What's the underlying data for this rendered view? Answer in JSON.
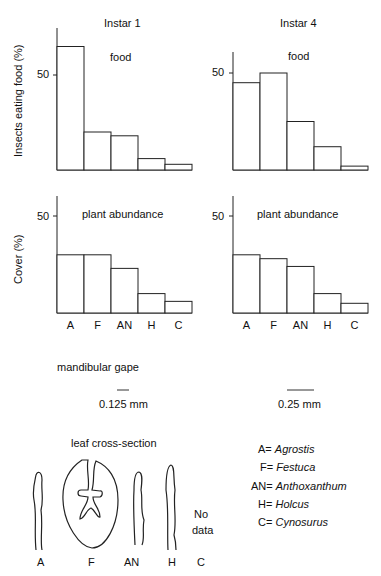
{
  "figure": {
    "ylabel_top": "Insects eating food (%)",
    "ylabel_bottom": "Cover (%)",
    "panels": [
      {
        "id": "instar1-food",
        "title": "Instar 1",
        "subtitle": "food",
        "tick": "50"
      },
      {
        "id": "instar4-food",
        "title": "Instar 4",
        "subtitle": "food",
        "tick": "50"
      },
      {
        "id": "instar1-plant",
        "subtitle": "plant abundance",
        "tick": "50"
      },
      {
        "id": "instar4-plant",
        "subtitle": "plant abundance",
        "tick": "50"
      }
    ],
    "categories": [
      "A",
      "F",
      "AN",
      "H",
      "C"
    ],
    "mandibular_gape": {
      "label": "mandibular gape",
      "instar1": "0.125 mm",
      "instar4": "0.25 mm"
    },
    "leaf": {
      "title": "leaf cross-section",
      "labels": [
        "A",
        "F",
        "AN",
        "H",
        "C"
      ],
      "no_data": [
        "No",
        "data"
      ]
    },
    "legend": [
      {
        "abbr": "A=",
        "name": "Agrostis"
      },
      {
        "abbr": "F=",
        "name": "Festuca"
      },
      {
        "abbr": "AN=",
        "name": "Anthoxanthum"
      },
      {
        "abbr": "H=",
        "name": "Holcus"
      },
      {
        "abbr": "C=",
        "name": "Cynosurus"
      }
    ]
  },
  "chart_data": [
    {
      "type": "bar",
      "title": "Instar 1",
      "subtitle": "food",
      "categories": [
        "A",
        "F",
        "AN",
        "H",
        "C"
      ],
      "values": [
        65,
        20,
        18,
        6,
        3
      ],
      "ylabel": "Insects eating food (%)",
      "yticks": [
        50
      ],
      "ylim": [
        0,
        70
      ]
    },
    {
      "type": "bar",
      "title": "Instar 4",
      "subtitle": "food",
      "categories": [
        "A",
        "F",
        "AN",
        "H",
        "C"
      ],
      "values": [
        45,
        50,
        25,
        12,
        2
      ],
      "ylabel": "Insects eating food (%)",
      "yticks": [
        50
      ],
      "ylim": [
        0,
        60
      ]
    },
    {
      "type": "bar",
      "title": "Instar 1",
      "subtitle": "plant abundance",
      "categories": [
        "A",
        "F",
        "AN",
        "H",
        "C"
      ],
      "values": [
        30,
        30,
        23,
        10,
        6
      ],
      "ylabel": "Cover (%)",
      "yticks": [
        50
      ],
      "ylim": [
        0,
        60
      ]
    },
    {
      "type": "bar",
      "title": "Instar 4",
      "subtitle": "plant abundance",
      "categories": [
        "A",
        "F",
        "AN",
        "H",
        "C"
      ],
      "values": [
        30,
        28,
        24,
        10,
        5
      ],
      "ylabel": "Cover (%)",
      "yticks": [
        50
      ],
      "ylim": [
        0,
        60
      ]
    }
  ]
}
